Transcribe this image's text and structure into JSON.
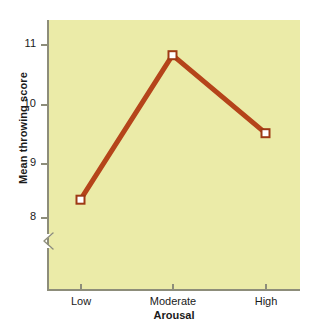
{
  "chart_data": {
    "type": "line",
    "title": "",
    "subtitle": "",
    "xlabel": "Arousal",
    "ylabel": "Mean throwing score",
    "categories": [
      "Low",
      "Moderate",
      "High"
    ],
    "values": [
      8.3,
      10.8,
      9.45
    ],
    "series": [
      {
        "name": "Mean throwing score",
        "values": [
          8.3,
          10.8,
          9.45
        ]
      }
    ],
    "y_ticks": [
      8,
      9,
      10,
      11
    ],
    "y_tick_labels": [
      "8",
      "9",
      "10",
      "11"
    ],
    "ylim": [
      7.75,
      11.35
    ],
    "axis_break": true,
    "axis_break_note": "zigzag break on y-axis below 8",
    "grid": false,
    "legend": false,
    "legend_position": "none",
    "marker": "open-square",
    "colors": {
      "line": "#b5441a",
      "marker_fill": "#ffffff",
      "marker_edge": "#9e3a14",
      "panel_background": "#ebeba8",
      "axis": "#8d8d7a",
      "text": "#1a1a1a",
      "figure_background": "#ffffff"
    }
  },
  "axes": {
    "y_title": "Mean throwing score",
    "x_title": "Arousal",
    "y_labels": [
      "11",
      "10",
      "9",
      "8"
    ],
    "x_labels": [
      "Low",
      "Moderate",
      "High"
    ]
  },
  "icons": {
    "axis_break": "axis-break-zigzag-icon"
  }
}
